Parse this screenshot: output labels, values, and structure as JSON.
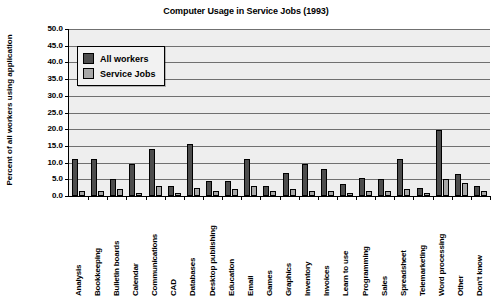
{
  "chart_data": {
    "type": "bar",
    "title": "Computer Usage in Service Jobs (1993)",
    "xlabel": "",
    "ylabel": "Percent of all workers using application",
    "ylim": [
      0,
      50
    ],
    "ytick_step": 5,
    "grid": true,
    "legend_position": "upper-left-inside",
    "ytick_labels": [
      "50.0",
      "45.0",
      "40.0",
      "35.0",
      "30.0",
      "25.0",
      "20.0",
      "15.0",
      "10.0",
      "5.0",
      "0.0"
    ],
    "categories": [
      "Analysis",
      "Bookkeeping",
      "Bulletin boards",
      "Calendar",
      "Communications",
      "CAD",
      "Databases",
      "Desktop publishing",
      "Education",
      "Email",
      "Games",
      "Graphics",
      "Inventory",
      "Invoices",
      "Learn to use",
      "Programming",
      "Sales",
      "Spreadsheet",
      "Telemarketing",
      "Word processing",
      "Other",
      "Don't know"
    ],
    "series": [
      {
        "name": "All workers",
        "color": "#4d4d4d",
        "values": [
          11.0,
          11.0,
          5.0,
          9.5,
          14.0,
          3.0,
          15.5,
          4.5,
          4.5,
          11.0,
          3.0,
          7.0,
          9.5,
          8.0,
          3.5,
          5.5,
          5.0,
          11.0,
          2.5,
          19.7,
          6.5,
          3.0
        ]
      },
      {
        "name": "Service Jobs",
        "color": "#a8a8a8",
        "values": [
          1.5,
          1.5,
          2.0,
          1.0,
          3.0,
          1.0,
          2.5,
          1.5,
          2.0,
          3.0,
          1.5,
          2.0,
          1.5,
          1.5,
          1.0,
          1.5,
          1.5,
          2.0,
          1.0,
          5.0,
          4.0,
          1.5
        ]
      }
    ]
  },
  "legend": {
    "items": [
      {
        "label": "All workers"
      },
      {
        "label": "Service Jobs"
      }
    ]
  }
}
